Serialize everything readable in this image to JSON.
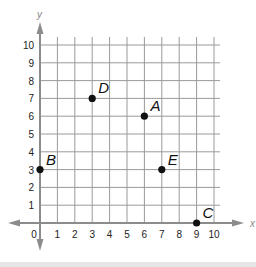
{
  "chart_data": {
    "type": "scatter",
    "title": "",
    "xlabel": "x",
    "ylabel": "y",
    "xlim": [
      0,
      10
    ],
    "ylim": [
      0,
      10
    ],
    "grid": true,
    "x_ticks": [
      "0",
      "1",
      "2",
      "3",
      "4",
      "5",
      "6",
      "7",
      "8",
      "9",
      "10"
    ],
    "y_ticks": [
      "1",
      "2",
      "3",
      "4",
      "5",
      "6",
      "7",
      "8",
      "9",
      "10"
    ],
    "points": [
      {
        "label": "A",
        "x": 6,
        "y": 6
      },
      {
        "label": "B",
        "x": 0,
        "y": 3
      },
      {
        "label": "C",
        "x": 9,
        "y": 0
      },
      {
        "label": "D",
        "x": 3,
        "y": 7
      },
      {
        "label": "E",
        "x": 7,
        "y": 3
      }
    ]
  },
  "colors": {
    "grid": "#9a9a9a",
    "axis": "#8c8c8c",
    "point": "#111111",
    "text": "#222222"
  }
}
